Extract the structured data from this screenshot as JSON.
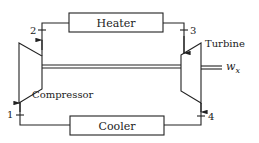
{
  "diagram": {
    "type": "Brayton cycle schematic",
    "components": {
      "heater": {
        "label": "Heater"
      },
      "cooler": {
        "label": "Cooler"
      },
      "compressor": {
        "label": "Compressor"
      },
      "turbine": {
        "label": "Turbine"
      }
    },
    "states": [
      "1",
      "2",
      "3",
      "4"
    ],
    "work_output": {
      "symbol": "w",
      "subscript": "x"
    },
    "flow": [
      {
        "from": "1",
        "to": "2",
        "through": "Compressor"
      },
      {
        "from": "2",
        "to": "3",
        "through": "Heater"
      },
      {
        "from": "3",
        "to": "4",
        "through": "Turbine"
      },
      {
        "from": "4",
        "to": "1",
        "through": "Cooler"
      }
    ],
    "colors": {
      "line": "#222222",
      "background": "#ffffff"
    }
  }
}
